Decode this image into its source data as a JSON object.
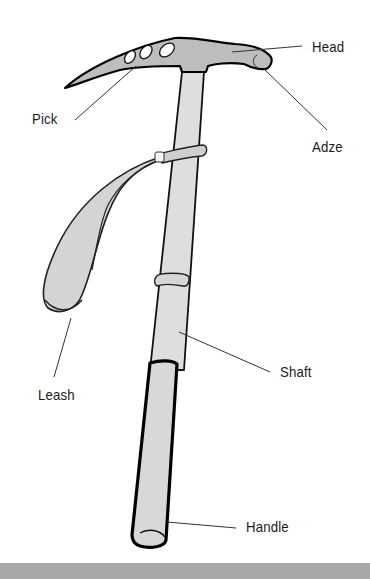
{
  "diagram": {
    "labels": {
      "head": "Head",
      "pick": "Pick",
      "adze": "Adze",
      "leash": "Leash",
      "shaft": "Shaft",
      "handle": "Handle"
    },
    "colors": {
      "fill": "#c4c4c4",
      "shaft_fill": "#dcdcdc",
      "outline": "#111111",
      "leader": "#333333",
      "footer": "#a8a8a8"
    }
  }
}
